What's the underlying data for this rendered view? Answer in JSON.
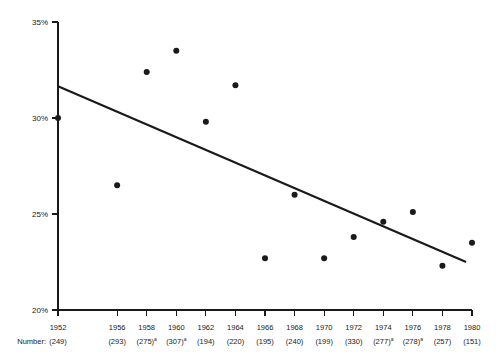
{
  "chart_data": {
    "type": "scatter",
    "title": "",
    "subtitle": "",
    "xlabel": "",
    "ylabel": "",
    "grid": false,
    "legend": false,
    "ylim": [
      20,
      35
    ],
    "y_ticks": [
      "20%",
      "25%",
      "30%",
      "35%"
    ],
    "y_tick_values": [
      20,
      25,
      30,
      35
    ],
    "y_axis_unit": "%",
    "x_row_label": "Number:",
    "categories": [
      "1952",
      "1956",
      "1958",
      "1960",
      "1962",
      "1964",
      "1966",
      "1968",
      "1970",
      "1972",
      "1974",
      "1976",
      "1978",
      "1980"
    ],
    "values": [
      30.0,
      26.5,
      32.4,
      33.5,
      29.8,
      31.7,
      22.7,
      26.0,
      22.7,
      23.8,
      24.6,
      25.1,
      22.3,
      23.5
    ],
    "x_positions": [
      1952,
      1956,
      1958,
      1960,
      1962,
      1964,
      1966,
      1968,
      1970,
      1972,
      1974,
      1976,
      1978,
      1980
    ],
    "numbers": [
      "(249)",
      "(293)",
      "(275)",
      "(307)",
      "(194)",
      "(220)",
      "(195)",
      "(240)",
      "(199)",
      "(330)",
      "(277)",
      "(278)",
      "(257)",
      "(151)"
    ],
    "number_footnotes": [
      "",
      "",
      "a",
      "a",
      "",
      "",
      "",
      "",
      "",
      "",
      "a",
      "a",
      "",
      ""
    ],
    "trend_line": {
      "label": "",
      "x_start": 1952,
      "y_start": 31.65,
      "x_end": 1979.6,
      "y_end": 22.5
    },
    "marker_color": "#1a1a1a",
    "line_color": "#1a1a1a",
    "background_color": "#ffffff"
  }
}
